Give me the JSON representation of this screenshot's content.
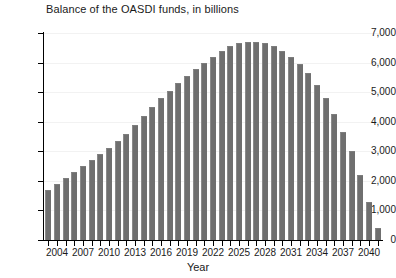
{
  "chart_data": {
    "type": "bar",
    "title": "Balance of the OASDI funds, in billions",
    "xlabel": "Year",
    "ylabel": "",
    "ylim": [
      0,
      7000
    ],
    "ytick_values": [
      0,
      1000,
      2000,
      3000,
      4000,
      5000,
      6000,
      7000
    ],
    "ytick_labels": [
      "0",
      "1,000",
      "2,000",
      "3,000",
      "4,000",
      "5,000",
      "6,000",
      "7,000"
    ],
    "grid": false,
    "legend": "none",
    "bar_color": "#6f6f6f",
    "xtick_labels": [
      "2004",
      "2007",
      "2010",
      "2013",
      "2016",
      "2019",
      "2022",
      "2025",
      "2028",
      "2031",
      "2034",
      "2037",
      "2040"
    ],
    "xtick_label_step": 3,
    "categories": [
      "2003",
      "2004",
      "2005",
      "2006",
      "2007",
      "2008",
      "2009",
      "2010",
      "2011",
      "2012",
      "2013",
      "2014",
      "2015",
      "2016",
      "2017",
      "2018",
      "2019",
      "2020",
      "2021",
      "2022",
      "2023",
      "2024",
      "2025",
      "2026",
      "2027",
      "2028",
      "2029",
      "2030",
      "2031",
      "2032",
      "2033",
      "2034",
      "2035",
      "2036",
      "2037",
      "2038",
      "2039",
      "2040",
      "2041"
    ],
    "values": [
      1700,
      1900,
      2100,
      2300,
      2500,
      2700,
      2900,
      3100,
      3350,
      3600,
      3900,
      4200,
      4500,
      4800,
      5050,
      5300,
      5550,
      5800,
      6000,
      6200,
      6400,
      6550,
      6650,
      6700,
      6700,
      6650,
      6550,
      6400,
      6200,
      5950,
      5650,
      5250,
      4800,
      4250,
      3650,
      3000,
      2200,
      1300,
      400
    ]
  }
}
